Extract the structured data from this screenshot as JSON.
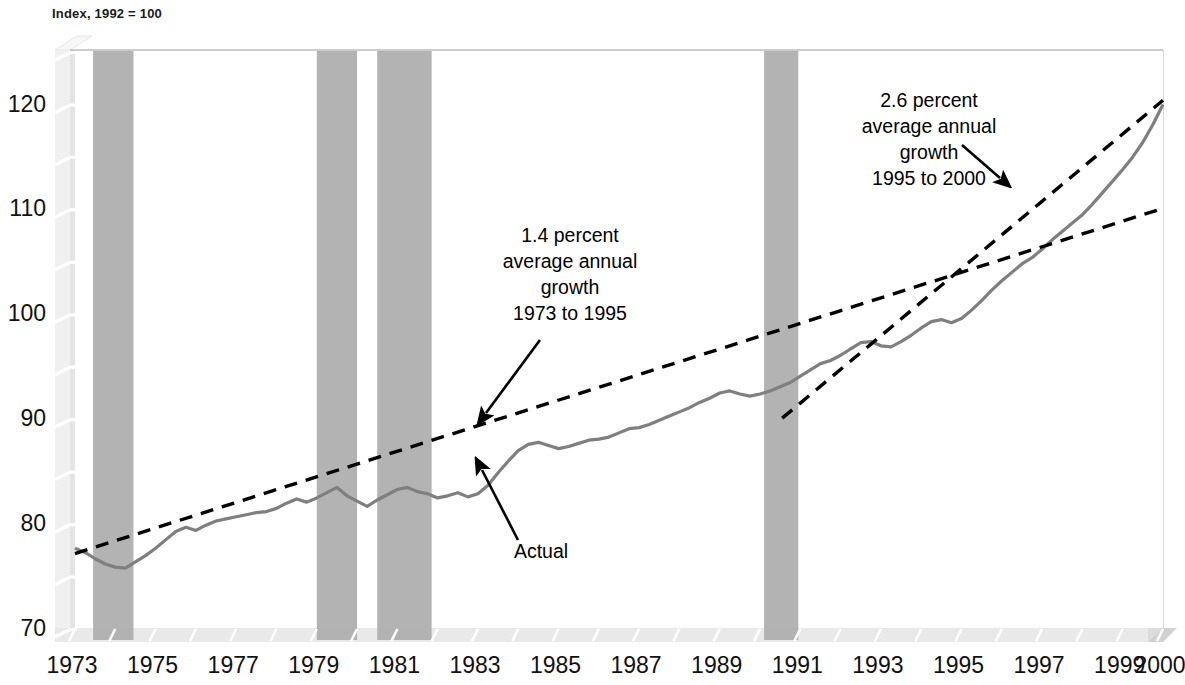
{
  "chart_data": {
    "type": "line",
    "title": "Index, 1992 = 100",
    "xlabel": "",
    "ylabel": "",
    "ylim": [
      70,
      125
    ],
    "xlim": [
      1973,
      2000
    ],
    "grid": false,
    "legend_position": "none",
    "y_major_ticks": [
      70,
      80,
      90,
      100,
      110,
      120
    ],
    "y_minor_ticks": [
      75,
      85,
      95,
      105,
      115,
      125
    ],
    "x_tick_labels": [
      "1973",
      "1975",
      "1977",
      "1979",
      "1981",
      "1983",
      "1985",
      "1987",
      "1989",
      "1991",
      "1993",
      "1995",
      "1997",
      "1999",
      "2000"
    ],
    "x_tick_values": [
      1973,
      1975,
      1977,
      1979,
      1981,
      1983,
      1985,
      1987,
      1989,
      1991,
      1993,
      1995,
      1997,
      1999,
      2000
    ],
    "series": [
      {
        "name": "Actual",
        "style": "solid",
        "color": "#7f7f7f",
        "x": [
          1973.0,
          1973.25,
          1973.5,
          1973.75,
          1974.0,
          1974.25,
          1974.5,
          1974.75,
          1975.0,
          1975.25,
          1975.5,
          1975.75,
          1976.0,
          1976.25,
          1976.5,
          1976.75,
          1977.0,
          1977.25,
          1977.5,
          1977.75,
          1978.0,
          1978.25,
          1978.5,
          1978.75,
          1979.0,
          1979.25,
          1979.5,
          1979.75,
          1980.0,
          1980.25,
          1980.5,
          1980.75,
          1981.0,
          1981.25,
          1981.5,
          1981.75,
          1982.0,
          1982.25,
          1982.5,
          1982.75,
          1983.0,
          1983.25,
          1983.5,
          1983.75,
          1984.0,
          1984.25,
          1984.5,
          1984.75,
          1985.0,
          1985.25,
          1985.5,
          1985.75,
          1986.0,
          1986.25,
          1986.5,
          1986.75,
          1987.0,
          1987.25,
          1987.5,
          1987.75,
          1988.0,
          1988.25,
          1988.5,
          1988.75,
          1989.0,
          1989.25,
          1989.5,
          1989.75,
          1990.0,
          1990.25,
          1990.5,
          1990.75,
          1991.0,
          1991.25,
          1991.5,
          1991.75,
          1992.0,
          1992.25,
          1992.5,
          1992.75,
          1993.0,
          1993.25,
          1993.5,
          1993.75,
          1994.0,
          1994.25,
          1994.5,
          1994.75,
          1995.0,
          1995.25,
          1995.5,
          1995.75,
          1996.0,
          1996.25,
          1996.5,
          1996.75,
          1997.0,
          1997.25,
          1997.5,
          1997.75,
          1998.0,
          1998.25,
          1998.5,
          1998.75,
          1999.0,
          1999.25,
          1999.5,
          1999.75,
          2000.0
        ],
        "y": [
          77.6,
          77.2,
          76.6,
          76.1,
          75.8,
          75.7,
          76.3,
          76.9,
          77.6,
          78.4,
          79.2,
          79.6,
          79.3,
          79.8,
          80.2,
          80.4,
          80.6,
          80.8,
          81.0,
          81.1,
          81.4,
          81.9,
          82.3,
          82.0,
          82.4,
          82.9,
          83.4,
          82.6,
          82.1,
          81.6,
          82.2,
          82.7,
          83.2,
          83.4,
          83.0,
          82.8,
          82.4,
          82.6,
          82.9,
          82.5,
          82.8,
          83.6,
          84.8,
          85.9,
          86.9,
          87.5,
          87.7,
          87.4,
          87.1,
          87.3,
          87.6,
          87.9,
          88.0,
          88.2,
          88.6,
          89.0,
          89.1,
          89.4,
          89.8,
          90.2,
          90.6,
          91.0,
          91.5,
          91.9,
          92.4,
          92.6,
          92.3,
          92.1,
          92.3,
          92.6,
          93.0,
          93.4,
          94.0,
          94.6,
          95.2,
          95.5,
          96.0,
          96.6,
          97.2,
          97.3,
          96.9,
          96.8,
          97.3,
          97.9,
          98.6,
          99.2,
          99.4,
          99.1,
          99.5,
          100.3,
          101.2,
          102.2,
          103.1,
          103.9,
          104.7,
          105.3,
          106.1,
          107.0,
          107.8,
          108.6,
          109.4,
          110.4,
          111.5,
          112.6,
          113.7,
          114.9,
          116.3,
          118.0,
          119.9
        ]
      },
      {
        "name": "1.4 percent trend 1973 to 1995",
        "style": "dashed",
        "color": "#000000",
        "x": [
          1973.0,
          2000.0
        ],
        "y": [
          77.1,
          110.0
        ]
      },
      {
        "name": "2.6 percent trend 1995 to 2000",
        "style": "dashed",
        "color": "#000000",
        "x": [
          1990.55,
          2000.0
        ],
        "y": [
          90.0,
          120.3
        ]
      }
    ],
    "shaded_bands": [
      {
        "label": "recession",
        "x0": 1973.45,
        "x1": 1974.45,
        "color": "#b3b3b3"
      },
      {
        "label": "recession",
        "x0": 1979.0,
        "x1": 1980.0,
        "color": "#b3b3b3"
      },
      {
        "label": "recession",
        "x0": 1980.5,
        "x1": 1981.85,
        "color": "#b3b3b3"
      },
      {
        "label": "recession",
        "x0": 1990.1,
        "x1": 1990.95,
        "color": "#b3b3b3"
      }
    ],
    "annotations": [
      {
        "id": "trend-1973-1995",
        "lines": [
          "1.4 percent",
          "average annual",
          "growth",
          "1973 to 1995"
        ],
        "text_x": 570,
        "text_y": 242,
        "arrow": {
          "x1": 540,
          "y1": 340,
          "x2": 486,
          "y2": 413
        }
      },
      {
        "id": "trend-1995-2000",
        "lines": [
          "2.6 percent",
          "average annual",
          "growth",
          "1995 to 2000"
        ],
        "text_x": 929,
        "text_y": 107,
        "arrow": {
          "x1": 962,
          "y1": 145,
          "x2": 1000,
          "y2": 178
        }
      },
      {
        "id": "actual-label",
        "lines": [
          "Actual"
        ],
        "text_x": 541,
        "text_y": 558,
        "arrow": {
          "x1": 518,
          "y1": 540,
          "x2": 482,
          "y2": 470
        }
      }
    ],
    "colors": {
      "series_actual": "#7f7f7f",
      "trend_line": "#000000",
      "recession_band": "#b3b3b3",
      "axis_wall": "#f0f0f0",
      "axis_floor": "#e6e6e6",
      "tick_mark": "#ffffff",
      "text": "#111111",
      "background": "#ffffff"
    }
  }
}
